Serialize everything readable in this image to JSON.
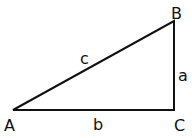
{
  "diagram": {
    "type": "right-triangle",
    "vertices": {
      "A": {
        "label": "A",
        "x": 13,
        "y": 110
      },
      "B": {
        "label": "B",
        "x": 174,
        "y": 21
      },
      "C": {
        "label": "C",
        "x": 174,
        "y": 110
      }
    },
    "sides": {
      "a": {
        "label": "a",
        "between": [
          "B",
          "C"
        ]
      },
      "b": {
        "label": "b",
        "between": [
          "A",
          "C"
        ]
      },
      "c": {
        "label": "c",
        "between": [
          "A",
          "B"
        ]
      }
    },
    "stroke_color": "#111111",
    "background": "#ffffff"
  }
}
